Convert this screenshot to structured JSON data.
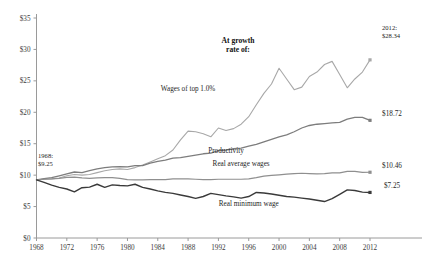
{
  "chart_data": {
    "type": "line",
    "title": "At growth rate of:",
    "xlabel": "",
    "ylabel": "",
    "xlim": [
      1968,
      2012
    ],
    "ylim": [
      0,
      35
    ],
    "grid": false,
    "legend_position": "inline-labels",
    "x_ticks": [
      1968,
      1972,
      1976,
      1980,
      1984,
      1988,
      1992,
      1996,
      2000,
      2004,
      2008,
      2012
    ],
    "y_ticks": [
      0,
      5,
      10,
      15,
      20,
      25,
      30,
      35
    ],
    "y_tick_labels": [
      "$0",
      "$5",
      "$10",
      "$15",
      "$20",
      "$25",
      "$30",
      "$35"
    ],
    "x_tick_labels": [
      "1968",
      "1972",
      "1976",
      "1980",
      "1984",
      "1988",
      "1992",
      "1996",
      "2000",
      "2004",
      "2008",
      "2012"
    ],
    "x": [
      1968,
      1969,
      1970,
      1971,
      1972,
      1973,
      1974,
      1975,
      1976,
      1977,
      1978,
      1979,
      1980,
      1981,
      1982,
      1983,
      1984,
      1985,
      1986,
      1987,
      1988,
      1989,
      1990,
      1991,
      1992,
      1993,
      1994,
      1995,
      1996,
      1997,
      1998,
      1999,
      2000,
      2001,
      2002,
      2003,
      2004,
      2005,
      2006,
      2007,
      2008,
      2009,
      2010,
      2011,
      2012
    ],
    "series": [
      {
        "name": "Wages of top 1.0%",
        "color": "#a8a8a8",
        "width": 1.1,
        "label_x": 1988,
        "label_y": 23.4,
        "end_value": 28.34,
        "end_label": "$28.34",
        "values": [
          9.25,
          9.35,
          9.4,
          9.55,
          9.9,
          10.1,
          10.0,
          10.1,
          10.4,
          10.7,
          10.9,
          11.0,
          10.9,
          11.2,
          11.6,
          12.1,
          12.6,
          13.1,
          14.0,
          15.6,
          17.0,
          16.9,
          16.6,
          16.1,
          17.5,
          17.1,
          17.4,
          18.1,
          19.3,
          21.2,
          23.0,
          24.5,
          27.0,
          25.3,
          23.6,
          24.0,
          25.7,
          26.4,
          27.6,
          28.1,
          26.0,
          23.9,
          25.3,
          26.4,
          28.34
        ]
      },
      {
        "name": "Productivity",
        "color": "#7d7d7d",
        "width": 1.3,
        "label_x": 1993,
        "label_y": 13.6,
        "end_value": 18.72,
        "end_label": "$18.72",
        "values": [
          9.25,
          9.45,
          9.6,
          9.9,
          10.2,
          10.5,
          10.4,
          10.7,
          11.0,
          11.2,
          11.3,
          11.35,
          11.3,
          11.5,
          11.5,
          11.9,
          12.2,
          12.4,
          12.7,
          12.8,
          13.0,
          13.2,
          13.4,
          13.5,
          13.9,
          14.0,
          14.2,
          14.3,
          14.6,
          14.9,
          15.3,
          15.7,
          16.1,
          16.4,
          16.9,
          17.5,
          17.9,
          18.1,
          18.2,
          18.3,
          18.4,
          18.9,
          19.2,
          19.2,
          18.72
        ]
      },
      {
        "name": "Real average wages",
        "color": "#8f8f8f",
        "width": 1.2,
        "label_x": 1995,
        "label_y": 11.4,
        "end_value": 10.46,
        "end_label": "$10.46",
        "values": [
          9.25,
          9.35,
          9.4,
          9.5,
          9.65,
          9.7,
          9.55,
          9.5,
          9.55,
          9.6,
          9.6,
          9.5,
          9.3,
          9.25,
          9.25,
          9.3,
          9.3,
          9.3,
          9.4,
          9.4,
          9.4,
          9.35,
          9.3,
          9.3,
          9.35,
          9.35,
          9.35,
          9.35,
          9.4,
          9.6,
          9.85,
          9.95,
          10.05,
          10.15,
          10.25,
          10.3,
          10.25,
          10.2,
          10.25,
          10.35,
          10.35,
          10.6,
          10.6,
          10.45,
          10.46
        ]
      },
      {
        "name": "Real minimum wage",
        "color": "#3a3a3a",
        "width": 1.4,
        "label_x": 1996,
        "label_y": 5.1,
        "end_value": 7.25,
        "end_label": "$7.25",
        "values": [
          9.25,
          8.85,
          8.4,
          8.05,
          7.8,
          7.35,
          8.0,
          8.1,
          8.55,
          8.05,
          8.45,
          8.35,
          8.3,
          8.55,
          8.05,
          7.8,
          7.5,
          7.25,
          7.1,
          6.85,
          6.6,
          6.3,
          6.6,
          7.1,
          6.9,
          6.7,
          6.55,
          6.35,
          6.6,
          7.25,
          7.15,
          7.0,
          6.8,
          6.6,
          6.5,
          6.35,
          6.2,
          6.0,
          5.8,
          6.25,
          6.95,
          7.65,
          7.55,
          7.3,
          7.25
        ]
      }
    ],
    "annotations": [
      {
        "id": "start-annotation",
        "line1": "1968:",
        "line2": "$9.25",
        "x": 38,
        "y": 158
      },
      {
        "id": "end-annotation",
        "line1": "2012:",
        "line2": "$28.34",
        "x": 382,
        "y": 30
      }
    ]
  }
}
